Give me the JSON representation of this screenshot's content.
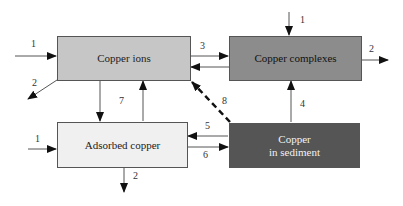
{
  "diagram": {
    "nodes": [
      {
        "id": "ions",
        "label": "Copper ions",
        "fill": "#c6c6c6",
        "text_color": "#222222"
      },
      {
        "id": "complexes",
        "label": "Copper complexes",
        "fill": "#8c8c8c",
        "text_color": "#111111"
      },
      {
        "id": "adsorbed",
        "label": "Adsorbed copper",
        "fill": "#f0f0f0",
        "text_color": "#222222"
      },
      {
        "id": "sediment",
        "label_line1": "Copper",
        "label_line2": "in sediment",
        "fill": "#555555",
        "text_color": "#f2f2f2"
      }
    ],
    "edge_labels": {
      "ions_in": "1",
      "ions_out": "2",
      "ions_to_complexes": "3",
      "complexes_in": "1",
      "complexes_out": "2",
      "sediment_to_complexes": "4",
      "sediment_to_adsorbed": "5",
      "adsorbed_to_sediment": "6",
      "ions_adsorbed": "7",
      "sediment_to_ions": "8",
      "adsorbed_in": "1",
      "adsorbed_out": "2"
    }
  }
}
